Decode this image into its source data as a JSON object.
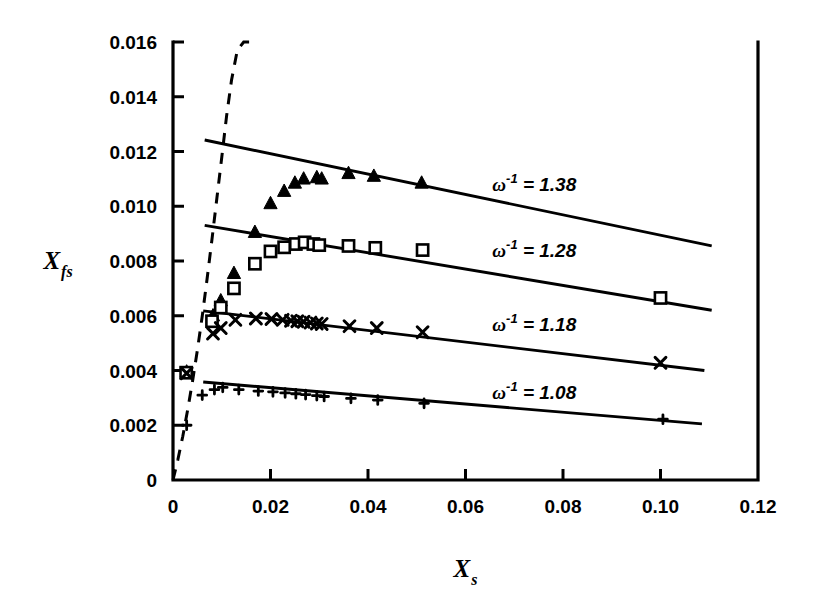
{
  "chart_data": {
    "type": "scatter",
    "title": "",
    "subtitle": "",
    "xlabel": "X",
    "xlabel_sub": "s",
    "ylabel": "X",
    "ylabel_sub": "fs",
    "xlim": [
      0,
      0.12
    ],
    "ylim": [
      0,
      0.016
    ],
    "grid": false,
    "legend_position": "inline-right",
    "x_ticks": [
      0,
      0.02,
      0.04,
      0.06,
      0.08,
      0.1,
      0.12
    ],
    "x_tick_labels": [
      "0",
      "0.02",
      "0.04",
      "0.06",
      "0.08",
      "0.10",
      "0.12"
    ],
    "y_ticks": [
      0,
      0.002,
      0.004,
      0.006,
      0.008,
      0.01,
      0.012,
      0.014,
      0.016
    ],
    "y_tick_labels": [
      "0",
      "0.002",
      "0.004",
      "0.006",
      "0.008",
      "0.010",
      "0.012",
      "0.014",
      "0.016"
    ],
    "annotations": [
      {
        "text": "ω",
        "sup": "-1",
        "rest": " = 1.38",
        "x": 0.0655,
        "y": 0.01055
      },
      {
        "text": "ω",
        "sup": "-1",
        "rest": " = 1.28",
        "x": 0.0655,
        "y": 0.00815
      },
      {
        "text": "ω",
        "sup": "-1",
        "rest": " = 1.18",
        "x": 0.0655,
        "y": 0.00545
      },
      {
        "text": "ω",
        "sup": "-1",
        "rest": " = 1.08",
        "x": 0.0655,
        "y": 0.00295
      }
    ],
    "series": [
      {
        "name": "ω⁻¹ = 1.38",
        "marker": "triangle",
        "fit_line": {
          "x": [
            0.0065,
            0.1105
          ],
          "y": [
            0.01242,
            0.00855
          ]
        },
        "x": [
          0.0028,
          0.0082,
          0.0098,
          0.0125,
          0.0168,
          0.02,
          0.0228,
          0.025,
          0.0268,
          0.0295,
          0.0305,
          0.036,
          0.0412,
          0.051
        ],
        "y": [
          0.00395,
          0.006,
          0.00655,
          0.00755,
          0.00905,
          0.0101,
          0.01055,
          0.01085,
          0.011,
          0.01105,
          0.011,
          0.0112,
          0.0111,
          0.01085
        ]
      },
      {
        "name": "ω⁻¹ = 1.28",
        "marker": "square",
        "fit_line": {
          "x": [
            0.0065,
            0.1105
          ],
          "y": [
            0.0093,
            0.0062
          ]
        },
        "x": [
          0.0027,
          0.008,
          0.0098,
          0.0125,
          0.0168,
          0.02,
          0.0228,
          0.0252,
          0.027,
          0.0288,
          0.03,
          0.036,
          0.0415,
          0.0512,
          0.1
        ],
        "y": [
          0.00392,
          0.0058,
          0.0063,
          0.007,
          0.0079,
          0.00835,
          0.0085,
          0.00862,
          0.00868,
          0.00862,
          0.00858,
          0.00855,
          0.00848,
          0.0084,
          0.00665
        ]
      },
      {
        "name": "ω⁻¹ = 1.18",
        "marker": "cross",
        "fit_line": {
          "x": [
            0.0062,
            0.109
          ],
          "y": [
            0.00618,
            0.004
          ]
        },
        "x": [
          0.0028,
          0.0082,
          0.0098,
          0.0128,
          0.017,
          0.0202,
          0.0225,
          0.0242,
          0.0255,
          0.0268,
          0.0282,
          0.0295,
          0.0305,
          0.0362,
          0.0418,
          0.0512,
          0.1
        ],
        "y": [
          0.0039,
          0.00535,
          0.00555,
          0.00585,
          0.0059,
          0.00588,
          0.00585,
          0.00582,
          0.0058,
          0.00578,
          0.00575,
          0.00572,
          0.0057,
          0.00562,
          0.00555,
          0.0054,
          0.00428
        ]
      },
      {
        "name": "ω⁻¹ = 1.08",
        "marker": "plus",
        "fit_line": {
          "x": [
            0.0062,
            0.1085
          ],
          "y": [
            0.00358,
            0.00205
          ]
        },
        "x": [
          0.0028,
          0.006,
          0.0085,
          0.0102,
          0.0135,
          0.0175,
          0.0205,
          0.023,
          0.0252,
          0.0272,
          0.0295,
          0.031,
          0.0365,
          0.042,
          0.0515,
          0.1005
        ],
        "y": [
          0.002,
          0.0031,
          0.0033,
          0.00338,
          0.0033,
          0.00325,
          0.00322,
          0.00318,
          0.00315,
          0.00312,
          0.00308,
          0.00305,
          0.00298,
          0.00292,
          0.0028,
          0.00222
        ]
      }
    ],
    "dashed_curve": {
      "style": "dashed",
      "x": [
        0.0,
        0.001,
        0.002,
        0.003,
        0.004,
        0.005,
        0.006,
        0.007,
        0.008,
        0.009,
        0.01,
        0.011,
        0.012,
        0.0132,
        0.0145,
        0.0156
      ],
      "y": [
        0.0,
        0.00075,
        0.0016,
        0.00255,
        0.0036,
        0.00475,
        0.006,
        0.00735,
        0.0088,
        0.0103,
        0.0118,
        0.0133,
        0.0146,
        0.0157,
        0.01625,
        0.0164
      ]
    }
  }
}
